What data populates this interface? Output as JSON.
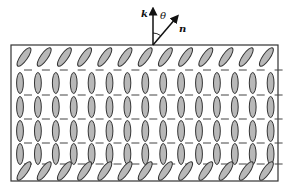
{
  "figure": {
    "labels": {
      "k": "k",
      "n": "n",
      "theta": "θ"
    },
    "colors": {
      "molecule_fill": "#b8b8b8",
      "molecule_stroke": "#333333",
      "border": "#333333",
      "arrow": "#111111"
    },
    "cell": {
      "x": 11,
      "y": 45,
      "width": 267,
      "height": 136
    },
    "surface_molecules": {
      "top_row_y": 57,
      "bottom_row_y": 171,
      "count": 13,
      "start_x": 24,
      "spacing": 20.2,
      "tilt_deg": 35
    },
    "bulk_molecules": {
      "rows_y": [
        83,
        107,
        131,
        154
      ],
      "columns": 15,
      "start_x": 20,
      "spacing": 17.9
    },
    "dash_rows_y": [
      70,
      95,
      119,
      143,
      164
    ],
    "director": {
      "origin": [
        153,
        45
      ],
      "k_tip": [
        153,
        11
      ],
      "n_tip": [
        176,
        18
      ]
    }
  }
}
